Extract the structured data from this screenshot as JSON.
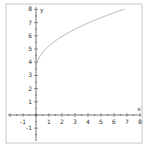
{
  "chart_data": {
    "type": "line",
    "title": "",
    "xlabel": "x",
    "ylabel": "y",
    "xlim": [
      -2,
      8
    ],
    "ylim": [
      -2,
      8
    ],
    "x_ticks": [
      -1,
      1,
      2,
      3,
      4,
      5,
      6,
      7,
      8
    ],
    "y_ticks": [
      -1,
      1,
      2,
      3,
      4,
      5,
      6,
      7,
      8
    ],
    "grid": false,
    "series": [
      {
        "name": "curve",
        "function": "y = sqrt(3x) + 3.5",
        "x": [
          0,
          0.5,
          1,
          2,
          3,
          4,
          5,
          6,
          6.8
        ],
        "values": [
          3.5,
          4.72,
          5.23,
          5.95,
          6.5,
          6.96,
          7.37,
          7.74,
          8.0
        ],
        "color": "#b0b0b0"
      }
    ]
  },
  "colors": {
    "axis": "#555555",
    "curve": "#b0b0b0",
    "frame": "#c8c8c8"
  }
}
